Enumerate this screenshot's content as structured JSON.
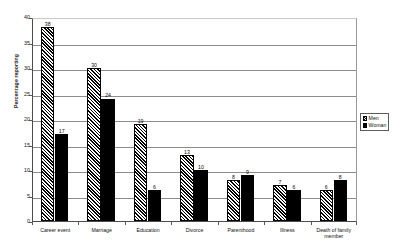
{
  "chart_data": {
    "type": "bar",
    "title": "",
    "xlabel": "",
    "ylabel": "Percentage reporting",
    "ylim": [
      0,
      40
    ],
    "ytick_step": 5,
    "yticks": [
      "0",
      "5",
      "10",
      "15",
      "20",
      "25",
      "30",
      "35",
      "40"
    ],
    "grid": true,
    "legend_position": "right",
    "categories": [
      "Career event",
      "Marriage",
      "Education",
      "Divorce",
      "Parenthood",
      "Illness",
      "Death of family member"
    ],
    "series": [
      {
        "name": "Men",
        "pattern": "diagonal-hatch",
        "color": "#000000",
        "values": [
          38,
          30,
          19,
          13,
          8,
          7,
          6
        ]
      },
      {
        "name": "Woman",
        "pattern": "solid",
        "color": "#000000",
        "values": [
          17,
          24,
          6,
          10,
          9,
          6,
          8
        ]
      }
    ],
    "data_labels": {
      "Career event": {
        "Men": "38",
        "Woman": "17"
      },
      "Marriage": {
        "Men": "30",
        "Woman": "24"
      },
      "Education": {
        "Men": "19",
        "Woman": "6"
      },
      "Divorce": {
        "Men": "13",
        "Woman": "10"
      },
      "Parenthood": {
        "Men": "8",
        "Woman": "9"
      },
      "Illness": {
        "Men": "7",
        "Woman": "6"
      },
      "Death of family member": {
        "Men": "6",
        "Woman": "8"
      }
    }
  },
  "legend": {
    "items": [
      {
        "label": "Men"
      },
      {
        "label": "Woman"
      }
    ]
  },
  "axes": {
    "y_title": "Percentage reporting"
  },
  "x_label_lines": [
    [
      "Career event"
    ],
    [
      "Marriage"
    ],
    [
      "Education"
    ],
    [
      "Divorce"
    ],
    [
      "Parenthood"
    ],
    [
      "Illness"
    ],
    [
      "Death of family",
      "member"
    ]
  ]
}
